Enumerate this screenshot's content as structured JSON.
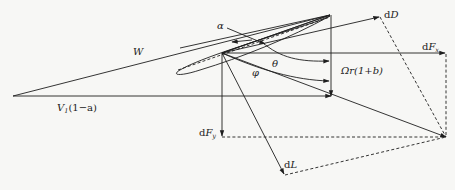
{
  "diagram": {
    "labels": {
      "W": "W",
      "V1_prefix": "V",
      "V1_sub": "1",
      "V1_suffix": "(1−a)",
      "alpha": "α",
      "theta": "θ",
      "phi": "φ",
      "omega_r": "Ωr(1+b)",
      "dD_d": "d",
      "dD_var": "D",
      "dFx_d": "d",
      "dFx_var": "F",
      "dFx_sub": "x",
      "dFy_d": "d",
      "dFy_var": "F",
      "dFy_sub": "y",
      "dL_d": "d",
      "dL_var": "L"
    },
    "colors": {
      "line": "#1e1e1e",
      "background": "#f7f7f5"
    }
  }
}
